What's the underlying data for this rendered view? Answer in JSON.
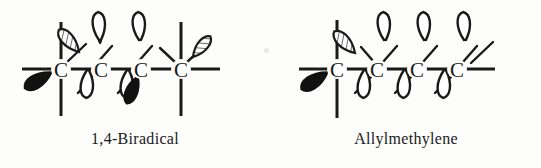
{
  "figure": {
    "background_color": "#fdfdfc",
    "ink_color": "#1a1a1a",
    "structures": [
      {
        "id": "biradical",
        "caption": "1,4-Biradical",
        "backbone_label": "C",
        "atom_count": 4,
        "atom_labels": [
          "C",
          "C",
          "C",
          "C"
        ],
        "bond_symbol": "—",
        "orbitals": [
          {
            "atom": 1,
            "position": "up-right",
            "fill": "hatched",
            "meaning": "sp3-hybrid-lobe"
          },
          {
            "atom": 1,
            "position": "down-left",
            "fill": "solid",
            "meaning": "radical-lobe"
          },
          {
            "atom": 2,
            "position": "up",
            "fill": "open",
            "meaning": "p-orbital-lobe"
          },
          {
            "atom": 2,
            "position": "down",
            "fill": "open",
            "meaning": "p-orbital-lobe"
          },
          {
            "atom": 3,
            "position": "up",
            "fill": "open",
            "meaning": "p-orbital-lobe"
          },
          {
            "atom": 3,
            "position": "down",
            "fill": "open",
            "meaning": "p-orbital-lobe"
          },
          {
            "atom": 3,
            "position": "down-right",
            "fill": "solid",
            "meaning": "radical-lobe"
          },
          {
            "atom": 4,
            "position": "up-right",
            "fill": "hatched",
            "meaning": "sp3-hybrid-lobe"
          }
        ],
        "vertical_axes_on_atoms": [
          1,
          4
        ]
      },
      {
        "id": "allylmethylene",
        "caption": "Allylmethylene",
        "backbone_label": "C",
        "atom_count": 4,
        "atom_labels": [
          "C",
          "C",
          "C",
          "C"
        ],
        "bond_symbol": "—",
        "orbitals": [
          {
            "atom": 1,
            "position": "down-left",
            "fill": "solid",
            "meaning": "carbene-lobe"
          },
          {
            "atom": 2,
            "position": "up-left",
            "fill": "hatched",
            "meaning": "sp3-hybrid-lobe"
          },
          {
            "atom": 2,
            "position": "up",
            "fill": "open",
            "meaning": "p-orbital-lobe"
          },
          {
            "atom": 2,
            "position": "down",
            "fill": "open",
            "meaning": "p-orbital-lobe"
          },
          {
            "atom": 3,
            "position": "up",
            "fill": "open",
            "meaning": "p-orbital-lobe"
          },
          {
            "atom": 3,
            "position": "down",
            "fill": "open",
            "meaning": "p-orbital-lobe"
          },
          {
            "atom": 4,
            "position": "up",
            "fill": "open",
            "meaning": "p-orbital-lobe"
          },
          {
            "atom": 4,
            "position": "down",
            "fill": "open",
            "meaning": "p-orbital-lobe"
          }
        ],
        "vertical_axes_on_atoms": [
          1
        ]
      }
    ]
  }
}
